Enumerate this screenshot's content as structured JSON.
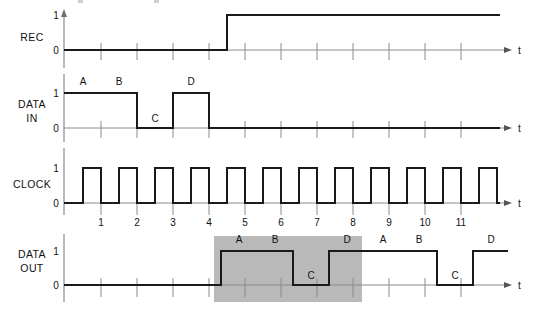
{
  "diagram": {
    "type": "timing-diagram",
    "title": "",
    "width": 533,
    "height": 311,
    "background_color": "#ffffff",
    "wave_color": "#1a1a1a",
    "axis_color": "#8a8a8a",
    "highlight_color": "#b9b9b9",
    "time_axis_label": "t",
    "level_labels": {
      "high": "1",
      "low": "0"
    },
    "tick_spacing_px": 36,
    "axis_origin_x": 64
  },
  "signals": [
    {
      "name": "REC",
      "label_lines": [
        "REC"
      ],
      "label_x": 32,
      "label_y": 41,
      "baseline_y": 50,
      "high_y": 15,
      "axis_top_y": 12,
      "axis_bottom_y": 68,
      "axis_end_x": 505,
      "tick_xs": [
        101,
        137,
        173,
        209,
        245,
        281,
        317,
        353,
        389,
        425,
        461
      ],
      "tick_numbers": [],
      "transitions": [
        {
          "x": 64,
          "level": 0
        },
        {
          "x": 227,
          "level": 1
        },
        {
          "x": 500,
          "level": 1
        }
      ],
      "annotations": []
    },
    {
      "name": "DATA IN",
      "label_lines": [
        "DATA",
        "IN"
      ],
      "label_x": 32,
      "label_y": 108,
      "baseline_y": 128,
      "high_y": 93,
      "axis_top_y": 74,
      "axis_bottom_y": 142,
      "axis_end_x": 505,
      "tick_xs": [
        101,
        137,
        173,
        209,
        245,
        281,
        317,
        353,
        389,
        425,
        461
      ],
      "tick_numbers": [],
      "transitions": [
        {
          "x": 64,
          "level": 1
        },
        {
          "x": 137,
          "level": 0
        },
        {
          "x": 173,
          "level": 1
        },
        {
          "x": 209,
          "level": 0
        },
        {
          "x": 500,
          "level": 0
        }
      ],
      "annotations": [
        {
          "text": "A",
          "x": 83,
          "y": 85
        },
        {
          "text": "B",
          "x": 119,
          "y": 85
        },
        {
          "text": "C",
          "x": 155,
          "y": 122
        },
        {
          "text": "D",
          "x": 191,
          "y": 85
        }
      ]
    },
    {
      "name": "CLOCK",
      "label_lines": [
        "CLOCK"
      ],
      "label_x": 32,
      "label_y": 188,
      "baseline_y": 203,
      "high_y": 168,
      "axis_top_y": 148,
      "axis_bottom_y": 215,
      "axis_end_x": 505,
      "tick_xs": [
        101,
        137,
        173,
        209,
        245,
        281,
        317,
        353,
        389,
        425,
        461
      ],
      "tick_numbers": [
        "1",
        "2",
        "3",
        "4",
        "5",
        "6",
        "7",
        "8",
        "9",
        "10",
        "11"
      ],
      "tick_number_y": 226,
      "clock": {
        "first_rise_x": 83,
        "period_px": 36,
        "duty_px": 18,
        "pulse_count": 12,
        "end_x": 500
      },
      "transitions": [],
      "annotations": []
    },
    {
      "name": "DATA OUT",
      "label_lines": [
        "DATA",
        "OUT"
      ],
      "label_x": 32,
      "label_y": 258,
      "baseline_y": 285,
      "high_y": 251,
      "axis_top_y": 234,
      "axis_bottom_y": 302,
      "axis_end_x": 505,
      "tick_xs": [
        101,
        137,
        173,
        209,
        245,
        281,
        317,
        353,
        389,
        425,
        461
      ],
      "tick_numbers": [],
      "transitions": [
        {
          "x": 64,
          "level": 0
        },
        {
          "x": 221,
          "level": 1
        },
        {
          "x": 293,
          "level": 0
        },
        {
          "x": 329,
          "level": 1
        },
        {
          "x": 437,
          "level": 0
        },
        {
          "x": 473,
          "level": 1
        },
        {
          "x": 508,
          "level": 1
        }
      ],
      "annotations": [
        {
          "text": "A",
          "x": 239,
          "y": 243
        },
        {
          "text": "B",
          "x": 275,
          "y": 243
        },
        {
          "text": "C",
          "x": 311,
          "y": 279
        },
        {
          "text": "D",
          "x": 347,
          "y": 243
        },
        {
          "text": "A",
          "x": 383,
          "y": 243
        },
        {
          "text": "B",
          "x": 419,
          "y": 243
        },
        {
          "text": "C",
          "x": 455,
          "y": 279
        },
        {
          "text": "D",
          "x": 491,
          "y": 243
        }
      ],
      "highlight": {
        "x": 214,
        "y": 236,
        "width": 148,
        "height": 66
      }
    }
  ]
}
